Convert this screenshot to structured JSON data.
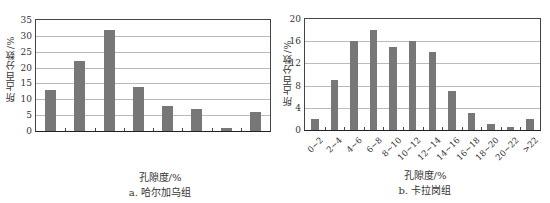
{
  "chart_data": [
    {
      "type": "bar",
      "title": "a. 哈尔加乌组",
      "xlabel": "孔隙度/%",
      "ylabel": "所占百分数/%",
      "categories": [
        "0~2",
        "2~4",
        "4~6",
        "6~8",
        "8~10",
        "10~12",
        "12~14",
        "14~16"
      ],
      "values": [
        13,
        22,
        32,
        14,
        8,
        7,
        1,
        6
      ],
      "ylim": [
        0,
        35
      ],
      "yticks": [
        "0",
        "5",
        "10",
        "15",
        "20",
        "25",
        "30",
        "35"
      ],
      "grid": true,
      "bar_color": "#777777"
    },
    {
      "type": "bar",
      "title": "b. 卡拉岗组",
      "xlabel": "孔隙度/%",
      "ylabel": "所占百分数/%",
      "categories": [
        "0~2",
        "2~4",
        "4~6",
        "6~8",
        "8~10",
        "10~12",
        "12~14",
        "14~16",
        "16~18",
        "18~20",
        "20~22",
        ">22"
      ],
      "values": [
        2,
        9,
        16,
        18,
        15,
        16,
        14,
        7,
        3,
        1,
        0.5,
        2
      ],
      "ylim": [
        0,
        20
      ],
      "yticks": [
        "0",
        "4",
        "8",
        "12",
        "16",
        "20"
      ],
      "grid": true,
      "bar_color": "#777777"
    }
  ]
}
